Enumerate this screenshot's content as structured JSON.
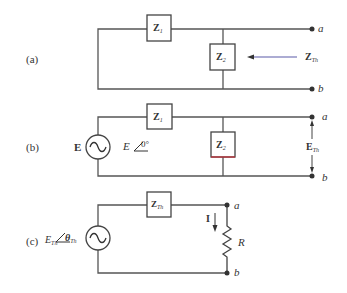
{
  "colors": {
    "wire": "#555555",
    "box_border": "#444444",
    "arrow_blue": "#5a5aa8",
    "accent_red": "#c0303a",
    "text": "#333333"
  },
  "panel_a": {
    "label": "(a)",
    "z1": {
      "main": "Z",
      "sub": "1"
    },
    "z2": {
      "main": "Z",
      "sub": "2"
    },
    "zth": {
      "main": "Z",
      "sub": "Th"
    },
    "node_a": "a",
    "node_b": "b"
  },
  "panel_b": {
    "label": "(b)",
    "source_label": "E",
    "source_phasor": {
      "mag": "E",
      "angle": "0°"
    },
    "z1": {
      "main": "Z",
      "sub": "1"
    },
    "z2": {
      "main": "Z",
      "sub": "2"
    },
    "eth": {
      "main": "E",
      "sub": "Th"
    },
    "node_a": "a",
    "node_b": "b"
  },
  "panel_c": {
    "label": "(c)",
    "source_phasor": {
      "mag": "E",
      "mag_sub": "Th",
      "angle": "θ",
      "angle_sub": "Th"
    },
    "zth": {
      "main": "Z",
      "sub": "Th"
    },
    "current": "I",
    "resistor": "R",
    "node_a": "a",
    "node_b": "b"
  }
}
